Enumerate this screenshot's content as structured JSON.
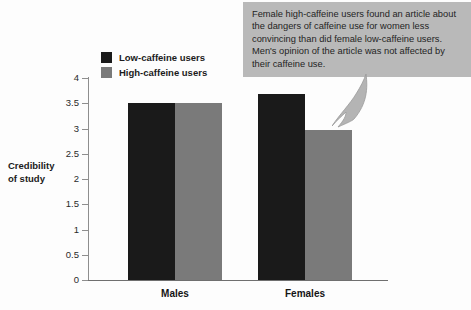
{
  "chart_data": {
    "type": "bar",
    "title": "",
    "subtitle": "",
    "xlabel": "",
    "ylabel": "Credibility of study",
    "ylabel_lines": [
      "Credibility",
      "of study"
    ],
    "categories": [
      "Males",
      "Females"
    ],
    "series": [
      {
        "name": "Low-caffeine users",
        "color": "#1a1a1a",
        "values": [
          3.5,
          3.68
        ]
      },
      {
        "name": "High-caffeine users",
        "color": "#7a7a7a",
        "values": [
          3.5,
          2.98
        ]
      }
    ],
    "ylim": [
      0,
      4
    ],
    "yticks": [
      0,
      0.5,
      1,
      1.5,
      2,
      2.5,
      3,
      3.5,
      4
    ],
    "ytick_labels": [
      "0",
      "0.5",
      "1",
      "1.5",
      "2",
      "2.5",
      "3",
      "3.5",
      "4"
    ],
    "grid": false,
    "legend_position": "top-left",
    "annotations": [
      {
        "text": "Female high-caffeine users found an article about the dangers of caffeine use for women less convincing than did female low-caffeine users. Men's opinion of the article was not affected by their caffeine use.",
        "points_to": "Females / High-caffeine users bar"
      }
    ]
  },
  "legend": {
    "items": [
      {
        "label": "Low-caffeine users",
        "color": "#1a1a1a"
      },
      {
        "label": "High-caffeine users",
        "color": "#7a7a7a"
      }
    ]
  },
  "callout": {
    "text": "Female high-caffeine users found an article about the dangers of caffeine use for women less convincing than did female low-caffeine users. Men's opinion of the article was not affected by their caffeine use.",
    "background": "#b9b9b9"
  }
}
